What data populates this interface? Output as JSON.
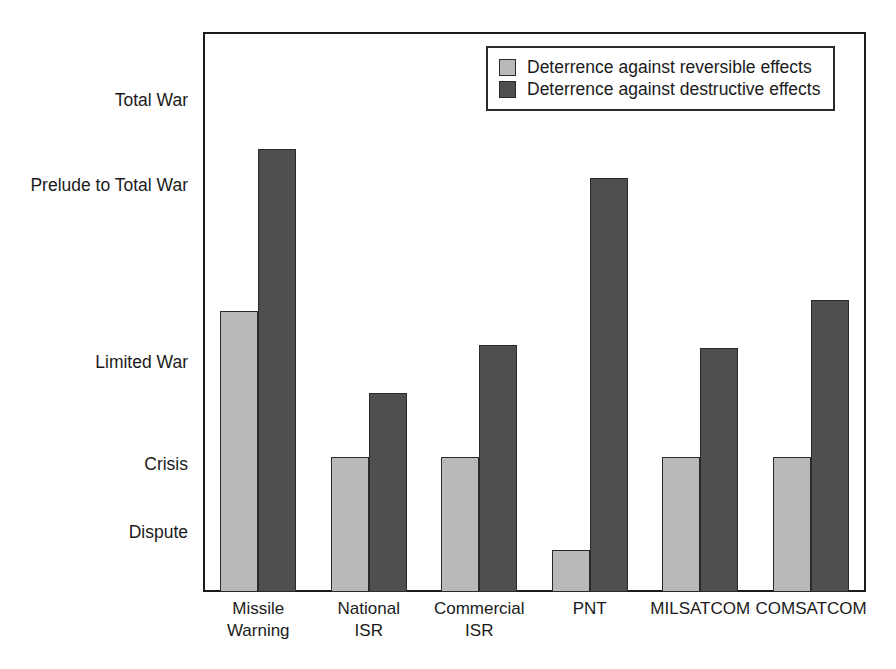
{
  "chart_data": {
    "type": "bar",
    "title": "",
    "xlabel": "",
    "ylabel": "",
    "grid": false,
    "legend_position": "top-right",
    "categories": [
      "Missile Warning",
      "National ISR",
      "Commercial ISR",
      "PNT",
      "MILSATCOM",
      "COMSATCOM"
    ],
    "category_lines": [
      [
        "Missile",
        "Warning"
      ],
      [
        "National",
        "ISR"
      ],
      [
        "Commercial",
        "ISR"
      ],
      [
        "PNT",
        ""
      ],
      [
        "MILSATCOM",
        ""
      ],
      [
        "COMSATCOM",
        ""
      ]
    ],
    "y_tick_labels": [
      "Total War",
      "Prelude to Total War",
      "Limited War",
      "Crisis",
      "Dispute"
    ],
    "y_tick_values": [
      7,
      5,
      3,
      2,
      1
    ],
    "ylim": [
      0.133,
      7.868
    ],
    "series": [
      {
        "name": "Deterrence against reversible effects",
        "color": "#b9b9b9",
        "values": [
          4.02,
          2.0,
          2.0,
          0.72,
          2.0,
          2.0
        ]
      },
      {
        "name": "Deterrence against destructive effects",
        "color": "#4f4f4f",
        "values": [
          6.25,
          2.88,
          3.54,
          5.85,
          3.51,
          4.16
        ]
      }
    ]
  },
  "legend": {
    "items": [
      {
        "label": "Deterrence against reversible effects",
        "swatch": "light-gray-swatch"
      },
      {
        "label": "Deterrence against destructive effects",
        "swatch": "dark-gray-swatch"
      }
    ]
  },
  "colors": {
    "light_bar": "#b9b9b9",
    "dark_bar": "#4f4f4f",
    "frame": "#1b1b1b",
    "background": "#ffffff",
    "text": "#1b1b1b"
  }
}
